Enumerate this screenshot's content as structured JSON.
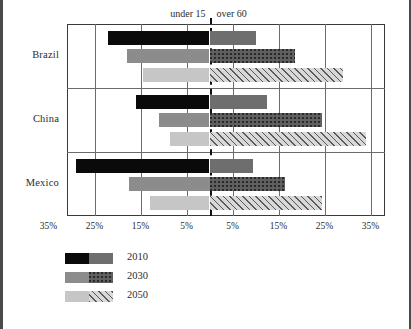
{
  "chart_data": {
    "type": "bar",
    "orientation": "horizontal",
    "subtype": "diverging-population-pyramid",
    "title": "",
    "xlabel": "",
    "ylabel": "",
    "categories": [
      "Brazil",
      "China",
      "Mexico"
    ],
    "side_labels": {
      "left": "under 15",
      "right": "over 60"
    },
    "axis": {
      "tick_labels_left": [
        "35%",
        "25%",
        "15%",
        "5%"
      ],
      "tick_labels_right": [
        "5%",
        "15%",
        "25%",
        "35%"
      ],
      "tick_values_left": [
        35,
        25,
        15,
        5
      ],
      "tick_values_right": [
        5,
        15,
        25,
        35
      ],
      "xlim": [
        -40,
        40
      ],
      "center_value": 0,
      "grid": true,
      "center_line_style": "dashed"
    },
    "legend": {
      "position": "bottom-left",
      "entries": [
        {
          "label": "2010",
          "left_fill": "black",
          "right_fill": "solid-gray"
        },
        {
          "label": "2030",
          "left_fill": "medium-gray",
          "right_fill": "checkered-gray"
        },
        {
          "label": "2050",
          "left_fill": "light-gray",
          "right_fill": "diagonal-hatch"
        }
      ]
    },
    "series": [
      {
        "name": "2010",
        "under_15": [
          22.0,
          16.0,
          29.0
        ],
        "over_60": [
          10.0,
          12.5,
          9.5
        ]
      },
      {
        "name": "2030",
        "under_15": [
          18.0,
          11.0,
          17.5
        ],
        "over_60": [
          18.5,
          24.5,
          16.5
        ]
      },
      {
        "name": "2050",
        "under_15": [
          14.5,
          8.5,
          13.0
        ],
        "over_60": [
          29.0,
          34.0,
          24.5
        ]
      }
    ]
  },
  "colors": {
    "black": "#0a0a0a",
    "dark_gray": "#6e6e6e",
    "medium_gray": "#8c8c8c",
    "light_gray": "#c6c6c6",
    "grid": "#6b6b6b",
    "text": "#2b2b2b",
    "frame": "#4a4a4a"
  }
}
